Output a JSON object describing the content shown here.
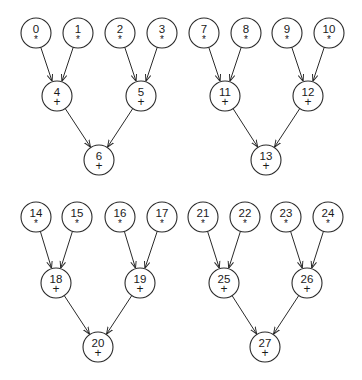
{
  "diagram": {
    "title": "",
    "node_radius": 15,
    "stroke_color": "#2a2a2a",
    "text_color": "#1a1a1a",
    "trees": [
      {
        "name": "tree-a",
        "nodes": [
          {
            "id": "0",
            "op": "*",
            "x": 36,
            "y": 33
          },
          {
            "id": "1",
            "op": "*",
            "x": 78,
            "y": 33
          },
          {
            "id": "2",
            "op": "*",
            "x": 120,
            "y": 33
          },
          {
            "id": "3",
            "op": "*",
            "x": 162,
            "y": 33
          },
          {
            "id": "4",
            "op": "+",
            "x": 57,
            "y": 96
          },
          {
            "id": "5",
            "op": "+",
            "x": 141,
            "y": 96
          },
          {
            "id": "6",
            "op": "+",
            "x": 99,
            "y": 160
          }
        ],
        "edges": [
          [
            "0",
            "4"
          ],
          [
            "1",
            "4"
          ],
          [
            "2",
            "5"
          ],
          [
            "3",
            "5"
          ],
          [
            "4",
            "6"
          ],
          [
            "5",
            "6"
          ]
        ]
      },
      {
        "name": "tree-b",
        "nodes": [
          {
            "id": "7",
            "op": "*",
            "x": 204,
            "y": 33
          },
          {
            "id": "8",
            "op": "*",
            "x": 246,
            "y": 33
          },
          {
            "id": "9",
            "op": "*",
            "x": 287,
            "y": 33
          },
          {
            "id": "10",
            "op": "*",
            "x": 329,
            "y": 33
          },
          {
            "id": "11",
            "op": "+",
            "x": 225,
            "y": 96
          },
          {
            "id": "12",
            "op": "+",
            "x": 308,
            "y": 96
          },
          {
            "id": "13",
            "op": "+",
            "x": 266,
            "y": 160
          }
        ],
        "edges": [
          [
            "7",
            "11"
          ],
          [
            "8",
            "11"
          ],
          [
            "9",
            "12"
          ],
          [
            "10",
            "12"
          ],
          [
            "11",
            "13"
          ],
          [
            "12",
            "13"
          ]
        ]
      },
      {
        "name": "tree-c",
        "nodes": [
          {
            "id": "14",
            "op": "*",
            "x": 36,
            "y": 217
          },
          {
            "id": "15",
            "op": "*",
            "x": 77,
            "y": 217
          },
          {
            "id": "16",
            "op": "*",
            "x": 120,
            "y": 217
          },
          {
            "id": "17",
            "op": "*",
            "x": 162,
            "y": 217
          },
          {
            "id": "18",
            "op": "+",
            "x": 56,
            "y": 283
          },
          {
            "id": "19",
            "op": "+",
            "x": 140,
            "y": 283
          },
          {
            "id": "20",
            "op": "+",
            "x": 98,
            "y": 347
          }
        ],
        "edges": [
          [
            "14",
            "18"
          ],
          [
            "15",
            "18"
          ],
          [
            "16",
            "19"
          ],
          [
            "17",
            "19"
          ],
          [
            "18",
            "20"
          ],
          [
            "19",
            "20"
          ]
        ]
      },
      {
        "name": "tree-d",
        "nodes": [
          {
            "id": "21",
            "op": "*",
            "x": 203,
            "y": 217
          },
          {
            "id": "22",
            "op": "*",
            "x": 245,
            "y": 217
          },
          {
            "id": "23",
            "op": "*",
            "x": 286,
            "y": 217
          },
          {
            "id": "24",
            "op": "*",
            "x": 328,
            "y": 217
          },
          {
            "id": "25",
            "op": "+",
            "x": 224,
            "y": 283
          },
          {
            "id": "26",
            "op": "+",
            "x": 307,
            "y": 283
          },
          {
            "id": "27",
            "op": "+",
            "x": 265,
            "y": 347
          }
        ],
        "edges": [
          [
            "21",
            "25"
          ],
          [
            "22",
            "25"
          ],
          [
            "23",
            "26"
          ],
          [
            "24",
            "26"
          ],
          [
            "25",
            "27"
          ],
          [
            "26",
            "27"
          ]
        ]
      }
    ]
  }
}
